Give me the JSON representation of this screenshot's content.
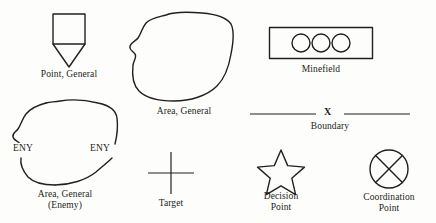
{
  "figure": {
    "kind": "military-tactical-symbol-legend",
    "background_color": "#fdfdfb",
    "ink_color": "#231f20"
  },
  "symbols": [
    {
      "id": "point-general",
      "icon": "square-with-downward-point-icon",
      "label": "Point, General",
      "label_line1": "Point, General",
      "label_line2": ""
    },
    {
      "id": "area-general",
      "icon": "irregular-closed-blob-icon",
      "label": "Area, General",
      "label_line1": "Area, General",
      "label_line2": ""
    },
    {
      "id": "minefield",
      "icon": "rectangle-with-three-circles-icon",
      "label": "Minefield",
      "label_line1": "Minefield",
      "label_line2": ""
    },
    {
      "id": "area-general-enemy",
      "icon": "irregular-closed-blob-enemy-icon",
      "label": "Area, General (Enemy)",
      "label_line1": "Area, General",
      "label_line2": "(Enemy)",
      "inline_marks": [
        "ENY",
        "ENY"
      ]
    },
    {
      "id": "boundary",
      "icon": "horizontal-line-with-x-icon",
      "label": "Boundary",
      "label_line1": "Boundary",
      "label_line2": "",
      "center_mark": "X"
    },
    {
      "id": "target",
      "icon": "cross-hair-plus-icon",
      "label": "Target",
      "label_line1": "Target",
      "label_line2": ""
    },
    {
      "id": "decision-point",
      "icon": "five-pointed-star-outline-icon",
      "label": "Decision Point",
      "label_line1": "Decision",
      "label_line2": "Point"
    },
    {
      "id": "coordination-point",
      "icon": "circle-with-x-icon",
      "label": "Coordination Point",
      "label_line1": "Coordination",
      "label_line2": "Point"
    }
  ]
}
